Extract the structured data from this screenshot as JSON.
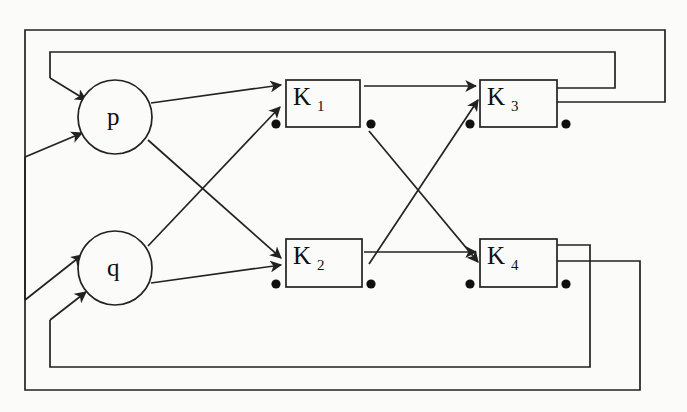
{
  "diagram": {
    "type": "block-diagram",
    "background_color": "#fbfbf9",
    "line_color": "#222222",
    "text_color": "#101010",
    "canvas": {
      "width": 687,
      "height": 412
    },
    "circles": [
      {
        "id": "p",
        "label": "p",
        "cx": 115,
        "cy": 117,
        "r": 37
      },
      {
        "id": "q",
        "label": "q",
        "cx": 115,
        "cy": 268,
        "r": 37
      }
    ],
    "boxes": [
      {
        "id": "K1",
        "main": "K",
        "sub": "1",
        "x": 286,
        "y": 80,
        "w": 74,
        "h": 47
      },
      {
        "id": "K3",
        "main": "K",
        "sub": "3",
        "x": 480,
        "y": 80,
        "w": 77,
        "h": 47
      },
      {
        "id": "K2",
        "main": "K",
        "sub": "2",
        "x": 286,
        "y": 239,
        "w": 76,
        "h": 48
      },
      {
        "id": "K4",
        "main": "K",
        "sub": "4",
        "x": 480,
        "y": 239,
        "w": 77,
        "h": 48
      }
    ],
    "terminal_dots": [
      {
        "for": "K1",
        "side": "left",
        "x": 276,
        "y": 124
      },
      {
        "for": "K1",
        "side": "right",
        "x": 371,
        "y": 124
      },
      {
        "for": "K3",
        "side": "left",
        "x": 470,
        "y": 124
      },
      {
        "for": "K3",
        "side": "right",
        "x": 566,
        "y": 124
      },
      {
        "for": "K2",
        "side": "left",
        "x": 276,
        "y": 284
      },
      {
        "for": "K2",
        "side": "right",
        "x": 371,
        "y": 284
      },
      {
        "for": "K4",
        "side": "left",
        "x": 470,
        "y": 284
      },
      {
        "for": "K4",
        "side": "right",
        "x": 566,
        "y": 284
      }
    ],
    "arrows": [
      {
        "id": "ext-in-p",
        "from": "outer-left-rail",
        "to": "p",
        "x1": 25,
        "y1": 157,
        "x2": 82,
        "y2": 133
      },
      {
        "id": "fb-in-p",
        "from": "inner-top-rail",
        "to": "p",
        "x1": 50,
        "y1": 78,
        "x2": 86,
        "y2": 100
      },
      {
        "id": "ext-in-q",
        "from": "outer-bottom-rail",
        "to": "q",
        "x1": 50,
        "y1": 320,
        "x2": 86,
        "y2": 292
      },
      {
        "id": "fb-in-q",
        "from": "inner-bottom-rail",
        "to": "q",
        "x1": 25,
        "y1": 300,
        "x2": 82,
        "y2": 255
      },
      {
        "id": "p-to-K1",
        "from": "p",
        "to": "K1",
        "x1": 151,
        "y1": 103,
        "x2": 281,
        "y2": 85
      },
      {
        "id": "p-to-K2",
        "from": "p",
        "to": "K2",
        "x1": 148,
        "y1": 140,
        "x2": 281,
        "y2": 258
      },
      {
        "id": "q-to-K1",
        "from": "q",
        "to": "K1",
        "x1": 148,
        "y1": 246,
        "x2": 280,
        "y2": 107
      },
      {
        "id": "q-to-K2",
        "from": "q",
        "to": "K2",
        "x1": 151,
        "y1": 283,
        "x2": 281,
        "y2": 265
      },
      {
        "id": "K1-to-K3",
        "from": "K1",
        "to": "K3",
        "x1": 364,
        "y1": 86,
        "x2": 476,
        "y2": 86
      },
      {
        "id": "K1-to-K4",
        "from": "K1",
        "to": "K4",
        "x1": 369,
        "y1": 131,
        "x2": 478,
        "y2": 262
      },
      {
        "id": "K2-to-K3",
        "from": "K2",
        "to": "K3",
        "x1": 369,
        "y1": 264,
        "x2": 478,
        "y2": 100
      },
      {
        "id": "K2-to-K4",
        "from": "K2",
        "to": "K4",
        "x1": 364,
        "y1": 252,
        "x2": 476,
        "y2": 252
      }
    ],
    "feedback_rails": [
      {
        "id": "outer-rail",
        "desc": "K4 lower output around outside to p input",
        "points": "557,261 640,261 640,390 25,390 25,157"
      },
      {
        "id": "second-rail",
        "desc": "K3 lower output around outside to q input",
        "points": "557,102 665,102 665,30 25,30 25,300"
      },
      {
        "id": "inner-rail-top",
        "desc": "K3 upper output to p feedback input",
        "points": "557,88 615,88 615,52 50,52 50,78"
      },
      {
        "id": "inner-rail-bottom",
        "desc": "K4 upper output to q feedback input",
        "points": "557,245 590,245 590,367 50,367 50,320"
      }
    ]
  }
}
